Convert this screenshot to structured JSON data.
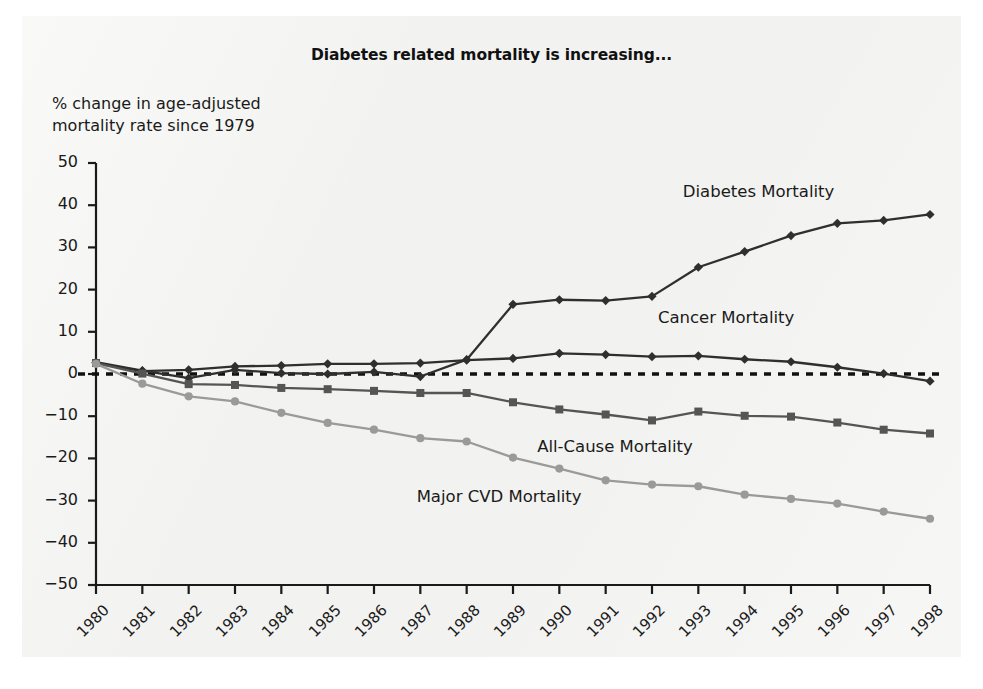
{
  "chart_data": {
    "type": "line",
    "title": "Diabetes related mortality is increasing...",
    "ylabel": "% change in age-adjusted\nmortality rate since 1979",
    "xlabel": "",
    "ylim": [
      -50,
      50
    ],
    "yticks": [
      50,
      40,
      30,
      20,
      10,
      0,
      -10,
      -20,
      -30,
      -40,
      -50
    ],
    "ytick_labels": [
      "50",
      "40",
      "30",
      "20",
      "10",
      "0",
      "−10",
      "−20",
      "−30",
      "−40",
      "−50"
    ],
    "grid": false,
    "zero_line": true,
    "zero_line_style": "dashed",
    "legend_position": "inline-right",
    "categories": [
      1980,
      1981,
      1982,
      1983,
      1984,
      1985,
      1986,
      1987,
      1988,
      1989,
      1990,
      1991,
      1992,
      1993,
      1994,
      1995,
      1996,
      1997,
      1998
    ],
    "xtick_labels": [
      "1980",
      "1981",
      "1982",
      "1983",
      "1984",
      "1985",
      "1986",
      "1987",
      "1988",
      "1989",
      "1990",
      "1991",
      "1992",
      "1993",
      "1994",
      "1995",
      "1996",
      "1997",
      "1998"
    ],
    "series": [
      {
        "name": "Diabetes Mortality",
        "color": "#2f2f2f",
        "marker": "diamond",
        "label_x": 1994.3,
        "label_y": 43.0,
        "values": [
          2.8,
          0.8,
          -1.0,
          1.0,
          0.2,
          0.0,
          0.5,
          -0.6,
          3.4,
          16.5,
          17.6,
          17.4,
          18.4,
          25.3,
          29.0,
          32.8,
          35.7,
          36.4,
          37.8
        ]
      },
      {
        "name": "Cancer Mortality",
        "color": "#2f2f2f",
        "marker": "diamond",
        "label_x": 1993.6,
        "label_y": 13.0,
        "values": [
          2.6,
          0.7,
          1.0,
          1.8,
          2.0,
          2.4,
          2.4,
          2.6,
          3.3,
          3.7,
          4.9,
          4.6,
          4.1,
          4.3,
          3.5,
          2.9,
          1.6,
          0.1,
          -1.7
        ]
      },
      {
        "name": "All-Cause Mortality",
        "color": "#555555",
        "marker": "square",
        "label_x": 1991.2,
        "label_y": -17.5,
        "values": [
          2.6,
          0.1,
          -2.4,
          -2.6,
          -3.3,
          -3.6,
          -4.0,
          -4.5,
          -4.5,
          -6.7,
          -8.4,
          -9.6,
          -11.0,
          -8.9,
          -9.9,
          -10.1,
          -11.5,
          -13.2,
          -14.1
        ]
      },
      {
        "name": "Major CVD Mortality",
        "color": "#9a9a9a",
        "marker": "circle",
        "label_x": 1988.7,
        "label_y": -29.5,
        "values": [
          2.4,
          -2.3,
          -5.3,
          -6.5,
          -9.2,
          -11.6,
          -13.2,
          -15.2,
          -16.0,
          -19.8,
          -22.4,
          -25.2,
          -26.2,
          -26.6,
          -28.6,
          -29.6,
          -30.7,
          -32.6,
          -34.3
        ]
      }
    ]
  }
}
